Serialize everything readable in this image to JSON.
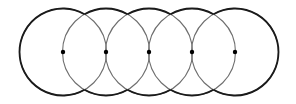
{
  "diagram": {
    "type": "overlapping-circles-chain",
    "circle_count": 5,
    "center_y": 52,
    "radius": 43.5,
    "centers_x": [
      63,
      106,
      149,
      192,
      235
    ],
    "stroke_color_outer": "#1a1a1a",
    "stroke_color_inner": "#6e6e6e",
    "dot_color": "#000000",
    "dot_radius": 2.2,
    "background": "#ffffff"
  }
}
